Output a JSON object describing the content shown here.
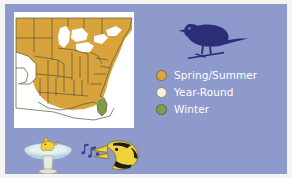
{
  "figure": {
    "background_color": "#8e99cc",
    "frame_color": "#f4f4f2",
    "title": ""
  },
  "map": {
    "name": "eastern-north-america-range-map",
    "background_color": "#ffffff",
    "outline_color": "#4a4a3c",
    "regions": [
      {
        "season": "Spring/Summer",
        "color": "#d9a33c"
      },
      {
        "season": "Year-Round",
        "color": "#f5efd8"
      },
      {
        "season": "Winter",
        "color": "#7d9b48"
      }
    ]
  },
  "bird_silhouette": {
    "name": "perched-songbird-silhouette",
    "color": "#2e2e78"
  },
  "legend": {
    "items": [
      {
        "label": "Spring/Summer",
        "color": "#dba63c",
        "icon": "circle-swatch-icon"
      },
      {
        "label": "Year-Round",
        "color": "#f6f0da",
        "icon": "circle-swatch-icon"
      },
      {
        "label": "Winter",
        "color": "#7f9e48",
        "icon": "circle-swatch-icon"
      }
    ],
    "text_color": "#ffffff"
  },
  "illustrations": [
    {
      "name": "bird-in-birdbath",
      "bird_color": "#f2d23a",
      "basin_color": "#cfe2e8",
      "pedestal_color": "#e6e9dd"
    },
    {
      "name": "singing-bird-with-music-notes",
      "bird_color": "#f2d23a",
      "note_color": "#3a3f8f"
    }
  ]
}
